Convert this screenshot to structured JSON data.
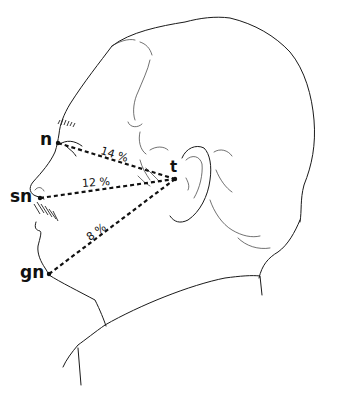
{
  "diagram": {
    "type": "anatomical-profile",
    "landmarks": [
      {
        "id": "n",
        "label": "n",
        "x": 58,
        "y": 143
      },
      {
        "id": "sn",
        "label": "sn",
        "x": 40,
        "y": 198
      },
      {
        "id": "gn",
        "label": "gn",
        "x": 49,
        "y": 274
      },
      {
        "id": "t",
        "label": "t",
        "x": 175,
        "y": 179
      }
    ],
    "measurements": [
      {
        "from": "n",
        "to": "t",
        "label": "14 %"
      },
      {
        "from": "sn",
        "to": "t",
        "label": "12 %"
      },
      {
        "from": "gn",
        "to": "t",
        "label": "8 %"
      }
    ]
  }
}
